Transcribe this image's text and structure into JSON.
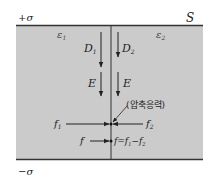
{
  "colors": {
    "fill": "#cbcbcb",
    "plate": "#333333",
    "line": "#222222",
    "text": "#222222"
  },
  "labels": {
    "top_charge": "+σ",
    "bottom_charge": "−σ",
    "surface": "S",
    "eps1": "ε",
    "eps1_sub": "1",
    "eps2": "ε",
    "eps2_sub": "2",
    "D1": "D",
    "D1_sub": "1",
    "D2": "D",
    "D2_sub": "2",
    "E_left": "E",
    "E_right": "E",
    "f1": "f",
    "f1_sub": "1",
    "f2": "f",
    "f2_sub": "2",
    "compressive_stress": "(압축응력)",
    "f": "f",
    "f_eq": "f=f",
    "f_eq_sub1": "1",
    "f_eq_minus": "−f",
    "f_eq_sub2": "2"
  }
}
